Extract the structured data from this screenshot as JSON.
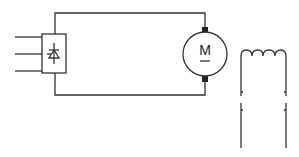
{
  "diagram": {
    "type": "circuit-schematic",
    "motor": {
      "label": "M"
    },
    "components": [
      "three-phase-input-lines",
      "rectifier-block",
      "dc-motor",
      "field-winding-coil"
    ],
    "colors": {
      "line": "#333333",
      "background": "#ffffff"
    }
  }
}
